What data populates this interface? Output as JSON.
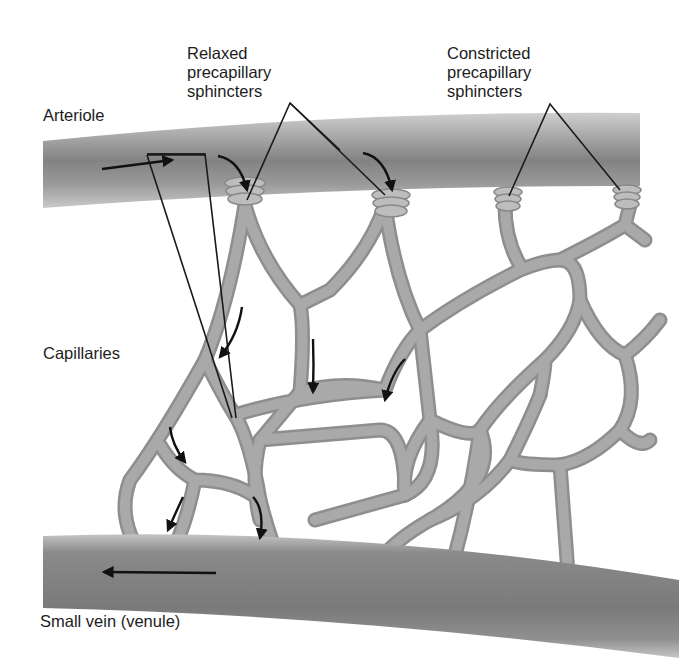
{
  "diagram": {
    "labels": {
      "arteriole": "Arteriole",
      "relaxed": [
        "Relaxed",
        "precapillary",
        "sphincters"
      ],
      "constricted": [
        "Constricted",
        "precapillary",
        "sphincters"
      ],
      "capillaries": "Capillaries",
      "venule": "Small vein (venule)"
    },
    "colors": {
      "vessel_outer": "#c4c4c4",
      "vessel_mid": "#9a9a9a",
      "vessel_core": "#7e7e7e",
      "capillary_fill": "#a6a6a6",
      "capillary_edge": "#8c8c8c",
      "sphincter": "#b8b8b8",
      "leader_line": "#1a1a1a",
      "arrow": "#111111",
      "background": "#ffffff"
    },
    "elements": [
      {
        "name": "arteriole",
        "direction": "left-to-right"
      },
      {
        "name": "venule",
        "direction": "right-to-left"
      },
      {
        "name": "relaxed-sphincters",
        "count": 2
      },
      {
        "name": "constricted-sphincters",
        "count": 2
      },
      {
        "name": "capillary-network",
        "flow_arrows": 9
      }
    ]
  }
}
